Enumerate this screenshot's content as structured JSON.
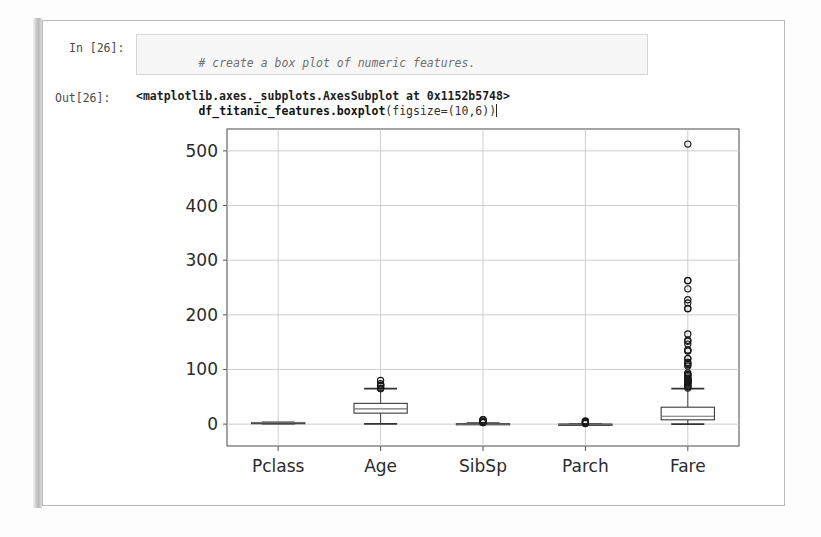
{
  "notebook": {
    "input_prompt": "In [26]:",
    "output_prompt": "Out[26]:",
    "code": {
      "comment": "# create a box plot of numeric features.",
      "statement_name": "df_titanic_features.boxplot",
      "statement_args": "(figsize=(10,6))"
    },
    "output_text": "<matplotlib.axes._subplots.AxesSubplot at 0x1152b5748>"
  },
  "chart_data": {
    "type": "box",
    "title": "",
    "xlabel": "",
    "ylabel": "",
    "grid": true,
    "legend": "none",
    "ylim": [
      -40,
      540
    ],
    "yticks": [
      0,
      100,
      200,
      300,
      400,
      500
    ],
    "ytick_labels": [
      "0",
      "100",
      "200",
      "300",
      "400",
      "500"
    ],
    "categories": [
      "Pclass",
      "Age",
      "SibSp",
      "Parch",
      "Fare"
    ],
    "boxes": [
      {
        "label": "Pclass",
        "whisker_low": 1,
        "q1": 2,
        "median": 3,
        "q3": 3,
        "whisker_high": 3,
        "outliers": []
      },
      {
        "label": "Age",
        "whisker_low": 0.42,
        "q1": 20.1,
        "median": 28,
        "q3": 38,
        "whisker_high": 64.8,
        "outliers": [
          65,
          65,
          66,
          70,
          70.5,
          71,
          71,
          74,
          80
        ]
      },
      {
        "label": "SibSp",
        "whisker_low": 0,
        "q1": 0,
        "median": 0,
        "q3": 1,
        "whisker_high": 2,
        "outliers": [
          3,
          3,
          4,
          4,
          5,
          5,
          8,
          8
        ]
      },
      {
        "label": "Parch",
        "whisker_low": 0,
        "q1": 0,
        "median": 0,
        "q3": 0,
        "whisker_high": 0,
        "outliers": [
          1,
          2,
          3,
          4,
          5,
          6
        ]
      },
      {
        "label": "Fare",
        "whisker_low": 0,
        "q1": 7.9,
        "median": 14.45,
        "q3": 31,
        "whisker_high": 65,
        "outliers": [
          66,
          69.3,
          69.55,
          71,
          73.5,
          75.25,
          76.29,
          76.73,
          77.29,
          77.96,
          78.2,
          78.85,
          79.2,
          79.65,
          80,
          81.86,
          82.17,
          83.16,
          83.48,
          86.5,
          89.1,
          90,
          91.08,
          93.5,
          106.43,
          108.9,
          110.88,
          113.27,
          120,
          120,
          133.65,
          134.5,
          135.63,
          146.52,
          151.55,
          153.46,
          164.87,
          211.34,
          211.5,
          221.78,
          227.53,
          247.52,
          262.38,
          263,
          512.33
        ]
      }
    ]
  }
}
